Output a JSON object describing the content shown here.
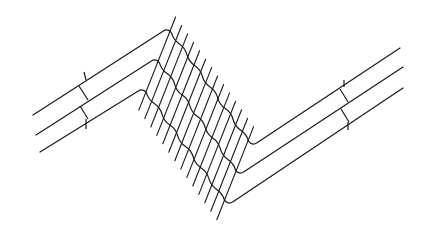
{
  "diagram": {
    "stroke_color": "#1a1a1a",
    "background_color": "#ffffff",
    "lines": [
      {
        "name": "line-1",
        "points": [
          [
            33,
            115
          ],
          [
            168,
            28
          ],
          [
            252,
            146
          ],
          [
            400,
            48
          ]
        ]
      },
      {
        "name": "line-2",
        "points": [
          [
            36,
            135
          ],
          [
            156,
            58
          ],
          [
            239,
            175
          ],
          [
            403,
            67
          ]
        ]
      },
      {
        "name": "line-3",
        "points": [
          [
            40,
            152
          ],
          [
            143,
            88
          ],
          [
            228,
            205
          ],
          [
            403,
            88
          ]
        ]
      }
    ],
    "hatch": {
      "count": 14,
      "description": "parallel slanted hatch lines crossing the diagonal band"
    },
    "break_marks": [
      {
        "side": "left",
        "x": 82
      },
      {
        "side": "right",
        "x": 346
      }
    ]
  }
}
